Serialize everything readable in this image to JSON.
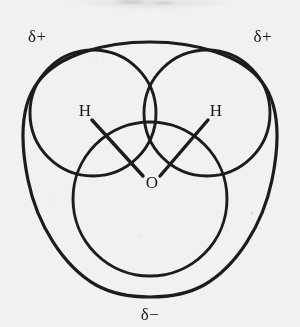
{
  "figure": {
    "background_color": "#f2f1ef",
    "ink_color": "#1b1b1b"
  },
  "labels": {
    "delta_plus_left": "δ+",
    "delta_plus_right": "δ+",
    "delta_minus_bottom": "δ−",
    "hydrogen_left": "H",
    "hydrogen_right": "H",
    "oxygen": "O"
  },
  "shapes": {
    "outer_envelope_name": "electron-cloud-envelope",
    "hydrogen_lobe_left_name": "hydrogen-lobe-left",
    "hydrogen_lobe_right_name": "hydrogen-lobe-right",
    "oxygen_lobe_name": "oxygen-lobe",
    "bond_left_name": "bond-h-o-left",
    "bond_right_name": "bond-h-o-right"
  }
}
